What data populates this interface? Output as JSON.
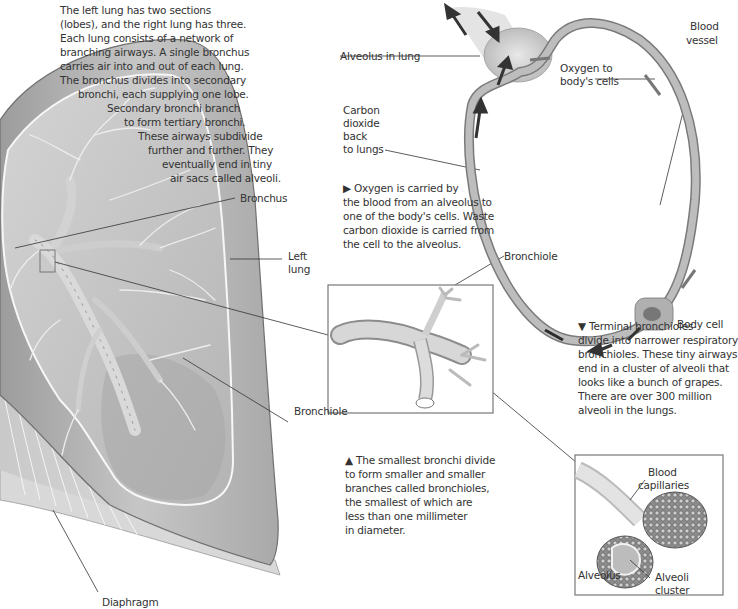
{
  "intro_text": {
    "lines": [
      "The left lung has two sections",
      "(lobes), and the right lung has three.",
      "Each lung consists of a network of",
      "branching airways. A single bronchus",
      "carries air into and out of each lung.",
      "The bronchus divides into secondary",
      "bronchi, each supplying one lobe.",
      "Secondary bronchi branch",
      "to form tertiary bronchi.",
      "These airways subdivide",
      "further and further. They",
      "eventually end in tiny",
      "air sacs called alveoli."
    ]
  },
  "lung_labels": {
    "bronchus": "Bronchus",
    "left_lung_1": "Left",
    "left_lung_2": "lung",
    "bronchiole": "Bronchiole",
    "diaphragm": "Diaphragm"
  },
  "circulation": {
    "alveolus_in_lung": "Alveolus in lung",
    "blood_vessel_1": "Blood",
    "blood_vessel_2": "vessel",
    "oxygen_1": "Oxygen to",
    "oxygen_2": "body's cells",
    "co2_lines": [
      "Carbon",
      "dioxide",
      "back",
      "to lungs"
    ],
    "body_cell": "Body cell",
    "caption_lines": [
      "▶ Oxygen is carried by",
      "the blood from an alveolus to",
      "one of the body's cells. Waste",
      "carbon dioxide is carried from",
      "the cell to the alveolus."
    ]
  },
  "bronchiole_inset": {
    "label": "Bronchiole",
    "caption_lines": [
      "▲ The smallest bronchi divide",
      "to form smaller and smaller",
      "branches called bronchioles,",
      "the smallest of which are",
      "less than one millimeter",
      "in diameter."
    ]
  },
  "alveoli_inset": {
    "caption_lines": [
      "▼ Terminal bronchioles",
      "divide into narrower respiratory",
      "bronchioles. These tiny airways",
      "end in a cluster of alveoli that",
      "looks like a bunch of grapes.",
      "There are over 300 million",
      "alveoli in the lungs."
    ],
    "blood_capillaries_1": "Blood",
    "blood_capillaries_2": "capillaries",
    "alveolus": "Alveolus",
    "alveoli_cluster_1": "Alveoli",
    "alveoli_cluster_2": "cluster"
  },
  "colors": {
    "lung_fill": "#b9b9b9",
    "lung_dark": "#8a8a8a",
    "vessel": "#a8a8a8",
    "arrow": "#3a3a3a",
    "leader_line": "#333333"
  }
}
